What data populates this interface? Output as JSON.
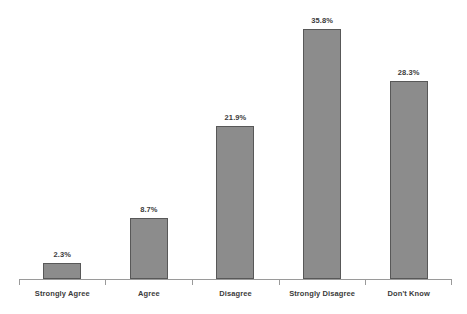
{
  "chart_data": {
    "type": "bar",
    "title": "",
    "subtitle": "",
    "xlabel": "",
    "ylabel": "",
    "categories": [
      "Strongly Agree",
      "Agree",
      "Disagree",
      "Strongly Disagree",
      "Don't Know"
    ],
    "values": [
      2.3,
      8.7,
      21.9,
      35.8,
      28.3
    ],
    "value_labels": [
      "2.3%",
      "8.7%",
      "21.9%",
      "35.8%",
      "28.3%"
    ],
    "ylim": [
      0,
      38.8
    ],
    "grid": false,
    "legend": null,
    "y_axis_visible": false,
    "x_axis_visible": true,
    "orientation": "vertical",
    "bar_fill_color": "#8c8c8c",
    "bar_border_color": "#585858",
    "axis_color": "#9a9a9a",
    "label_color": "#3b3b3b",
    "background_color": "#ffffff"
  }
}
